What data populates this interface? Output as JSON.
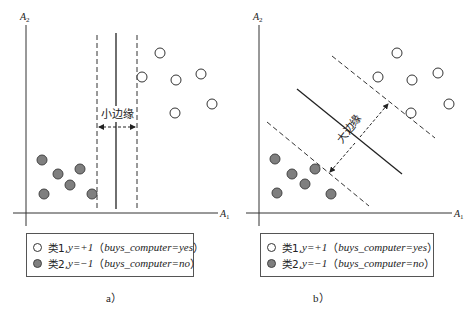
{
  "panels": [
    {
      "id": "a",
      "caption": "a）",
      "axis_labels": {
        "x": "A",
        "x_sub": "1",
        "y": "A",
        "y_sub": "2"
      },
      "margin_label": "小边缘",
      "margin_type": "small",
      "class1_points": [
        [
          142,
          77
        ],
        [
          160,
          53
        ],
        [
          176,
          80
        ],
        [
          201,
          74
        ],
        [
          212,
          104
        ],
        [
          175,
          113
        ]
      ],
      "class2_points": [
        [
          42,
          160
        ],
        [
          58,
          174
        ],
        [
          80,
          169
        ],
        [
          70,
          185
        ],
        [
          44,
          194
        ],
        [
          92,
          194
        ]
      ],
      "legend": [
        {
          "cls": "类1,",
          "eq": "y=+1",
          "note": "buys_computer=yes",
          "symbol": "open-circle"
        },
        {
          "cls": "类2,",
          "eq": "y=−1",
          "note": "buys_computer=no",
          "symbol": "filled-circle"
        }
      ]
    },
    {
      "id": "b",
      "caption": "b）",
      "axis_labels": {
        "x": "A",
        "x_sub": "1",
        "y": "A",
        "y_sub": "2"
      },
      "margin_label": "大边缘",
      "margin_type": "large",
      "class1_points": [
        [
          397,
          53
        ],
        [
          378,
          77
        ],
        [
          412,
          80
        ],
        [
          438,
          73
        ],
        [
          449,
          104
        ],
        [
          411,
          113
        ]
      ],
      "class2_points": [
        [
          275,
          159
        ],
        [
          292,
          174
        ],
        [
          315,
          169
        ],
        [
          305,
          184
        ],
        [
          277,
          193
        ],
        [
          331,
          194
        ]
      ],
      "legend": [
        {
          "cls": "类1,",
          "eq": "y=+1",
          "note": "buys_computer=yes",
          "symbol": "open-circle"
        },
        {
          "cls": "类2,",
          "eq": "y=−1",
          "note": "buys_computer=no",
          "symbol": "filled-circle"
        }
      ]
    }
  ],
  "colors": {
    "class1_fill": "#ffffff",
    "class2_fill": "#7f7f7f",
    "line": "#222222"
  }
}
